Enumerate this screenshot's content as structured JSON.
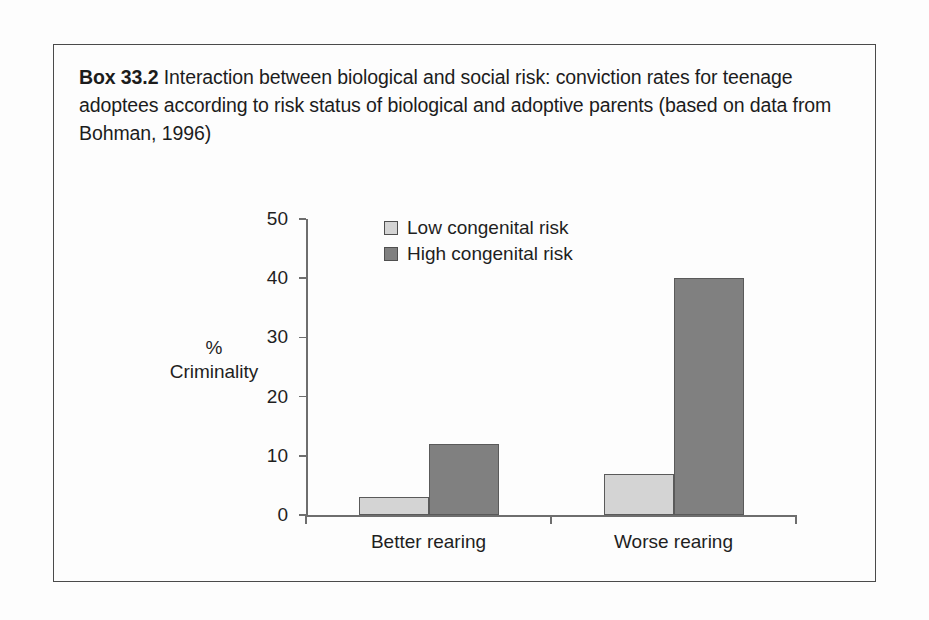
{
  "box": {
    "label": "Box 33.2",
    "caption": "Interaction between biological and social risk: conviction rates for teenage adoptees according to risk status of biological and adoptive parents (based on data from Bohman, 1996)"
  },
  "colors": {
    "low_risk_fill": "#d4d4d4",
    "high_risk_fill": "#808080",
    "bar_stroke": "#5a5a5a",
    "axis": "#6e6e6e",
    "text": "#1f1f1f",
    "box_border": "#4a4a4a",
    "background": "#fdfdfd"
  },
  "chart_data": {
    "type": "bar",
    "title": "",
    "categories": [
      "Better rearing",
      "Worse rearing"
    ],
    "series": [
      {
        "name": "Low congenital risk",
        "values": [
          3,
          7
        ],
        "color": "#d4d4d4"
      },
      {
        "name": "High congenital risk",
        "values": [
          12,
          40
        ],
        "color": "#808080"
      }
    ],
    "xlabel": "",
    "ylabel": "% Criminality",
    "ylabel_lines": [
      "%",
      "Criminality"
    ],
    "ylim": [
      0,
      50
    ],
    "yticks": [
      0,
      10,
      20,
      30,
      40,
      50
    ],
    "ytick_labels": [
      "0",
      "10",
      "20",
      "30",
      "40",
      "50"
    ],
    "grid": false,
    "legend": {
      "position": "top-center",
      "entries": [
        "Low congenital risk",
        "High congenital risk"
      ]
    }
  }
}
